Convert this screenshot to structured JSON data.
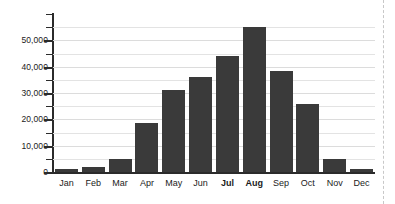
{
  "chart_data": {
    "type": "bar",
    "title": "",
    "subtitle": "",
    "xlabel": "",
    "ylabel": "",
    "categories": [
      "Jan",
      "Feb",
      "Mar",
      "Apr",
      "May",
      "Jun",
      "Jul",
      "Aug",
      "Sep",
      "Oct",
      "Nov",
      "Dec"
    ],
    "values": [
      1000,
      1800,
      5000,
      18500,
      31000,
      36000,
      44000,
      55000,
      38500,
      26000,
      4800,
      1200
    ],
    "series": [
      {
        "name": "Monthly total",
        "values": [
          1000,
          1800,
          5000,
          18500,
          31000,
          36000,
          44000,
          55000,
          38500,
          26000,
          4800,
          1200
        ]
      }
    ],
    "emphasized_categories": [
      "Jul",
      "Aug"
    ],
    "ylim": [
      0,
      60000
    ],
    "ytick_labels": [
      "0",
      "10,000",
      "20,000",
      "30,000",
      "40,000",
      "50,000"
    ],
    "ytick_values": [
      0,
      10000,
      20000,
      30000,
      40000,
      50000
    ],
    "yminor_tick_values": [
      5000,
      15000,
      25000,
      35000,
      45000,
      55000
    ],
    "grid": true,
    "grid_axis": "y",
    "legend": "none",
    "bar_color": "#3a3a3a",
    "grid_color": "#e3e3e3",
    "axis_color": "#2b2b2b",
    "marker_line_color": "#c8c8c8"
  },
  "annotations": {
    "right_edge_marker": "dashed-vertical-rule"
  }
}
